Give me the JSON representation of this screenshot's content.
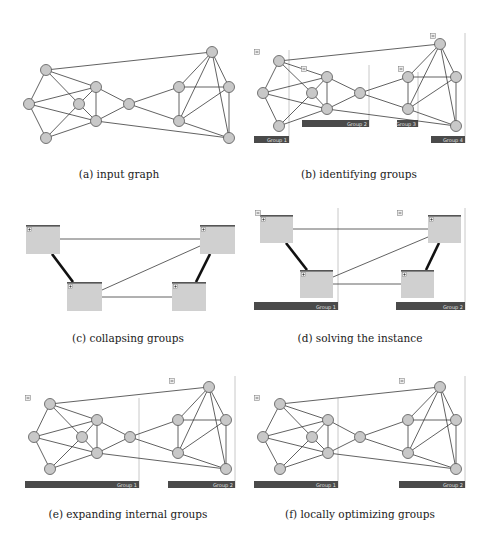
{
  "colors": {
    "node_fill": "#c8c8c8",
    "node_stroke": "#555555",
    "edge": "#3a3a3a",
    "thick_edge": "#111111",
    "group_bar": "#4a4a4a",
    "group_bar_text": "#e0e0e0",
    "group_border": "#c8c8c8",
    "box_fill": "#d0d0d0",
    "box_top": "#555555",
    "icon_fill": "#eeeeee",
    "icon_stroke": "#777777"
  },
  "graph": {
    "node_ids": [
      "A",
      "B",
      "C",
      "D",
      "E",
      "F",
      "G",
      "H",
      "I",
      "J",
      "K",
      "L"
    ],
    "edges": [
      [
        "A",
        "B"
      ],
      [
        "A",
        "I"
      ],
      [
        "A",
        "E"
      ],
      [
        "A",
        "D"
      ],
      [
        "B",
        "C"
      ],
      [
        "B",
        "E"
      ],
      [
        "B",
        "F"
      ],
      [
        "C",
        "D"
      ],
      [
        "C",
        "F"
      ],
      [
        "D",
        "E"
      ],
      [
        "D",
        "F"
      ],
      [
        "E",
        "F"
      ],
      [
        "E",
        "G"
      ],
      [
        "F",
        "G"
      ],
      [
        "F",
        "L"
      ],
      [
        "G",
        "H"
      ],
      [
        "G",
        "K"
      ],
      [
        "H",
        "I"
      ],
      [
        "H",
        "J"
      ],
      [
        "H",
        "K"
      ],
      [
        "I",
        "J"
      ],
      [
        "I",
        "K"
      ],
      [
        "I",
        "L"
      ],
      [
        "J",
        "K"
      ],
      [
        "J",
        "L"
      ],
      [
        "K",
        "L"
      ]
    ]
  },
  "panels": [
    {
      "id": "a",
      "caption": "(a) input graph",
      "caption_pos": [
        119,
        168
      ],
      "type": "graph",
      "nodes": {
        "A": [
          46,
          70
        ],
        "B": [
          29,
          104
        ],
        "C": [
          46,
          138
        ],
        "D": [
          79,
          104
        ],
        "E": [
          96,
          87
        ],
        "F": [
          96,
          121
        ],
        "G": [
          129,
          104
        ],
        "H": [
          179,
          87
        ],
        "I": [
          212,
          52
        ],
        "J": [
          229,
          87
        ],
        "K": [
          179,
          121
        ],
        "L": [
          229,
          138
        ]
      },
      "groups": [],
      "icons": []
    },
    {
      "id": "b",
      "caption": "(b) identifying groups",
      "caption_pos": [
        359,
        168
      ],
      "type": "graph",
      "nodes": {
        "A": [
          279,
          61
        ],
        "B": [
          263,
          93
        ],
        "C": [
          279,
          126
        ],
        "D": [
          312,
          93
        ],
        "E": [
          327,
          77
        ],
        "F": [
          327,
          109
        ],
        "G": [
          360,
          93
        ],
        "H": [
          408,
          77
        ],
        "I": [
          440,
          44
        ],
        "J": [
          456,
          77
        ],
        "K": [
          408,
          109
        ],
        "L": [
          456,
          126
        ]
      },
      "groups": [
        {
          "label": "Group 1",
          "bar": [
            254,
            136,
            35,
            7
          ],
          "border_x": 289,
          "border_top": 50
        },
        {
          "label": "Group 2",
          "bar": [
            302,
            120,
            67,
            7
          ],
          "border_x": 369,
          "border_top": 65
        },
        {
          "label": "Group 3",
          "bar": [
            397,
            120,
            21,
            7
          ],
          "border_x": 418,
          "border_top": 72
        },
        {
          "label": "Group 4",
          "bar": [
            431,
            136,
            34,
            7
          ],
          "border_x": 465,
          "border_top": 33
        }
      ],
      "icons": [
        {
          "kind": "minus",
          "pos": [
            257,
            52
          ]
        },
        {
          "kind": "minus",
          "pos": [
            304,
            69
          ]
        },
        {
          "kind": "minus",
          "pos": [
            401,
            69
          ]
        },
        {
          "kind": "minus",
          "pos": [
            433,
            36
          ]
        }
      ]
    },
    {
      "id": "c",
      "caption": "(c) collapsing groups",
      "caption_pos": [
        128,
        332
      ],
      "type": "boxes",
      "boxes": [
        [
          26,
          225,
          34,
          29
        ],
        [
          200,
          225,
          35,
          29
        ],
        [
          67,
          282,
          35,
          29
        ],
        [
          172,
          282,
          34,
          29
        ]
      ],
      "thin_edges": [
        [
          60,
          239,
          200,
          239
        ],
        [
          200,
          246,
          102,
          290
        ],
        [
          102,
          297,
          172,
          297
        ]
      ],
      "thick_edges": [
        [
          52,
          254,
          73,
          282
        ],
        [
          210,
          254,
          196,
          282
        ]
      ],
      "groups": [],
      "icons": []
    },
    {
      "id": "d",
      "caption": "(d) solving the instance",
      "caption_pos": [
        360,
        332
      ],
      "type": "boxes",
      "boxes": [
        [
          260,
          215,
          33,
          28
        ],
        [
          428,
          215,
          33,
          28
        ],
        [
          300,
          270,
          33,
          28
        ],
        [
          401,
          270,
          33,
          28
        ]
      ],
      "thin_edges": [
        [
          293,
          229,
          428,
          229
        ],
        [
          428,
          237,
          333,
          277
        ],
        [
          333,
          284,
          401,
          284
        ]
      ],
      "thick_edges": [
        [
          286,
          243,
          307,
          270
        ],
        [
          439,
          243,
          426,
          270
        ]
      ],
      "groups": [
        {
          "label": "Group 1",
          "bar": [
            254,
            302,
            84,
            8
          ],
          "border_x": 338,
          "border_top": 208
        },
        {
          "label": "Group 2",
          "bar": [
            396,
            302,
            69,
            8
          ],
          "border_x": 465,
          "border_top": 208
        }
      ],
      "icons": [
        {
          "kind": "minus",
          "pos": [
            258,
            213
          ]
        },
        {
          "kind": "minus",
          "pos": [
            400,
            213
          ]
        }
      ]
    },
    {
      "id": "e",
      "caption": "(e) expanding internal groups",
      "caption_pos": [
        128,
        508
      ],
      "type": "graph",
      "nodes": {
        "A": [
          50,
          404
        ],
        "B": [
          34,
          437
        ],
        "C": [
          50,
          469
        ],
        "D": [
          82,
          437
        ],
        "E": [
          97,
          420
        ],
        "F": [
          97,
          453
        ],
        "G": [
          130,
          437
        ],
        "H": [
          178,
          420
        ],
        "I": [
          209,
          387
        ],
        "J": [
          226,
          420
        ],
        "K": [
          178,
          453
        ],
        "L": [
          226,
          469
        ]
      },
      "groups": [
        {
          "label": "Group 1",
          "bar": [
            25,
            481,
            114,
            7
          ],
          "border_x": 139,
          "border_top": 398
        },
        {
          "label": "Group 2",
          "bar": [
            168,
            481,
            67,
            7
          ],
          "border_x": 235,
          "border_top": 376
        }
      ],
      "icons": [
        {
          "kind": "minus",
          "pos": [
            28,
            398
          ]
        },
        {
          "kind": "minus",
          "pos": [
            172,
            381
          ]
        }
      ]
    },
    {
      "id": "f",
      "caption": "(f) locally optimizing groups",
      "caption_pos": [
        360,
        508
      ],
      "type": "graph",
      "nodes": {
        "A": [
          280,
          404
        ],
        "B": [
          263,
          437
        ],
        "C": [
          280,
          469
        ],
        "D": [
          312,
          437
        ],
        "E": [
          328,
          420
        ],
        "F": [
          328,
          453
        ],
        "G": [
          360,
          437
        ],
        "H": [
          408,
          420
        ],
        "I": [
          440,
          387
        ],
        "J": [
          456,
          420
        ],
        "K": [
          408,
          453
        ],
        "L": [
          456,
          469
        ]
      },
      "groups": [
        {
          "label": "Group 1",
          "bar": [
            254,
            481,
            84,
            7
          ],
          "border_x": 338,
          "border_top": 398
        },
        {
          "label": "Group 2",
          "bar": [
            399,
            481,
            66,
            7
          ],
          "border_x": 465,
          "border_top": 376
        }
      ],
      "icons": [
        {
          "kind": "minus",
          "pos": [
            257,
            398
          ]
        },
        {
          "kind": "minus",
          "pos": [
            402,
            381
          ]
        }
      ]
    }
  ]
}
